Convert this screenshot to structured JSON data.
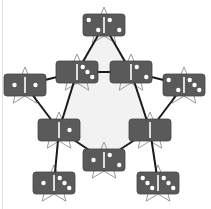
{
  "colors": {
    "domino": "#5a5a5a",
    "pip": "#ffffff",
    "divider": "#ffffff",
    "line": "#1a1a1a",
    "star": "#9a9a9a",
    "inner_fill": "#f2f2f2",
    "background": "#ffffff"
  },
  "dominoes": [
    {
      "id": "top",
      "x": 83,
      "y": 14,
      "left": 2,
      "right": 2
    },
    {
      "id": "inner-left",
      "x": 56,
      "y": 61,
      "left": 0,
      "right": 3
    },
    {
      "id": "inner-right",
      "x": 110,
      "y": 61,
      "left": 0,
      "right": 2
    },
    {
      "id": "outer-left",
      "x": 4,
      "y": 74,
      "left": 1,
      "right": 1
    },
    {
      "id": "outer-right",
      "x": 163,
      "y": 74,
      "left": 2,
      "right": 3
    },
    {
      "id": "mid-left",
      "x": 38,
      "y": 119,
      "left": 0,
      "right": 1
    },
    {
      "id": "mid-right",
      "x": 129,
      "y": 119,
      "left": 0,
      "right": 0
    },
    {
      "id": "bottom-center",
      "x": 83,
      "y": 149,
      "left": 1,
      "right": 2
    },
    {
      "id": "bottom-left",
      "x": 33,
      "y": 172,
      "left": 1,
      "right": 3
    },
    {
      "id": "bottom-right",
      "x": 137,
      "y": 172,
      "left": 3,
      "right": 3
    }
  ],
  "connections": [
    [
      "top",
      "inner-left"
    ],
    [
      "top",
      "inner-right"
    ],
    [
      "inner-left",
      "inner-right"
    ],
    [
      "inner-left",
      "outer-left"
    ],
    [
      "inner-right",
      "outer-right"
    ],
    [
      "inner-left",
      "mid-left"
    ],
    [
      "inner-right",
      "mid-right"
    ],
    [
      "outer-left",
      "mid-left"
    ],
    [
      "outer-right",
      "mid-right"
    ],
    [
      "mid-left",
      "bottom-center"
    ],
    [
      "mid-right",
      "bottom-center"
    ],
    [
      "mid-left",
      "bottom-left"
    ],
    [
      "mid-right",
      "bottom-right"
    ]
  ]
}
